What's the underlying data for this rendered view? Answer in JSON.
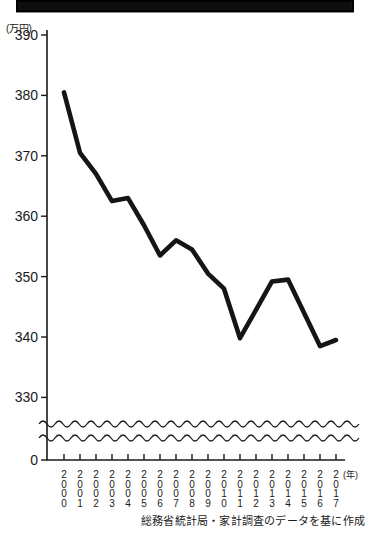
{
  "banner": {
    "title_text": ""
  },
  "axis": {
    "unit_label": "(万円)",
    "y_ticks": [
      "390",
      "380",
      "370",
      "360",
      "350",
      "340",
      "330",
      "0"
    ],
    "x_unit": "(年)"
  },
  "source_note": "総務省統計局・家計調査のデータを基に作成",
  "chart_data": {
    "type": "line",
    "title": "",
    "xlabel": "(年)",
    "ylabel": "(万円)",
    "ylim": [
      330,
      390
    ],
    "axis_break": true,
    "grid": false,
    "legend": "none",
    "line_color": "#151515",
    "categories": [
      "2000",
      "2001",
      "2002",
      "2003",
      "2004",
      "2005",
      "2006",
      "2007",
      "2008",
      "2009",
      "2010",
      "2011",
      "2012",
      "2013",
      "2014",
      "2015",
      "2016",
      "2017"
    ],
    "x": [
      2000,
      2001,
      2002,
      2003,
      2004,
      2005,
      2006,
      2007,
      2008,
      2009,
      2010,
      2011,
      2012,
      2013,
      2014,
      2015,
      2016,
      2017
    ],
    "values": [
      380.5,
      370.5,
      367.0,
      362.5,
      363.0,
      358.5,
      353.5,
      356.0,
      354.5,
      350.5,
      348.0,
      339.8,
      344.5,
      349.2,
      349.5,
      344.0,
      338.5,
      339.5
    ],
    "y_tick_values": [
      390,
      380,
      370,
      360,
      350,
      340,
      330,
      0
    ],
    "ylabels_stacked": [
      [
        "2",
        "0",
        "0",
        "0"
      ],
      [
        "2",
        "0",
        "0",
        "1"
      ],
      [
        "2",
        "0",
        "0",
        "2"
      ],
      [
        "2",
        "0",
        "0",
        "3"
      ],
      [
        "2",
        "0",
        "0",
        "4"
      ],
      [
        "2",
        "0",
        "0",
        "5"
      ],
      [
        "2",
        "0",
        "0",
        "6"
      ],
      [
        "2",
        "0",
        "0",
        "7"
      ],
      [
        "2",
        "0",
        "0",
        "8"
      ],
      [
        "2",
        "0",
        "0",
        "9"
      ],
      [
        "2",
        "0",
        "1",
        "0"
      ],
      [
        "2",
        "0",
        "1",
        "1"
      ],
      [
        "2",
        "0",
        "1",
        "2"
      ],
      [
        "2",
        "0",
        "1",
        "3"
      ],
      [
        "2",
        "0",
        "1",
        "4"
      ],
      [
        "2",
        "0",
        "1",
        "5"
      ],
      [
        "2",
        "0",
        "1",
        "6"
      ],
      [
        "2",
        "0",
        "1",
        "7"
      ]
    ]
  }
}
